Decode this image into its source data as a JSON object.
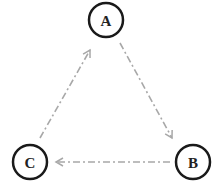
{
  "diagram": {
    "type": "directed-cycle",
    "nodes": [
      {
        "id": "A",
        "label": "A",
        "cx": 106,
        "cy": 20,
        "r": 17
      },
      {
        "id": "B",
        "label": "B",
        "cx": 193,
        "cy": 162,
        "r": 17
      },
      {
        "id": "C",
        "label": "C",
        "cx": 30,
        "cy": 162,
        "r": 17
      }
    ],
    "edges": [
      {
        "from": "A",
        "to": "B",
        "style": "dash-dot",
        "color": "#a8a8a8"
      },
      {
        "from": "B",
        "to": "C",
        "style": "dash-dot",
        "color": "#a8a8a8"
      },
      {
        "from": "C",
        "to": "A",
        "style": "dash-dot",
        "color": "#a8a8a8"
      }
    ],
    "colors": {
      "node_stroke": "#1a1a1a",
      "edge": "#a8a8a8",
      "background": "#ffffff"
    }
  }
}
